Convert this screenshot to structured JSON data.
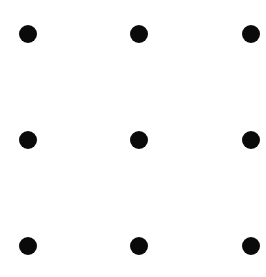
{
  "diagram": {
    "type": "dot-grid",
    "rows": 3,
    "columns": 3,
    "dot_color": "#0a0a0a",
    "background_color": "#ffffff",
    "dot_diameter_px": 18,
    "dots": [
      {
        "row": 0,
        "col": 0,
        "x": 28,
        "y": 34
      },
      {
        "row": 0,
        "col": 1,
        "x": 139,
        "y": 34
      },
      {
        "row": 0,
        "col": 2,
        "x": 251,
        "y": 34
      },
      {
        "row": 1,
        "col": 0,
        "x": 28,
        "y": 140
      },
      {
        "row": 1,
        "col": 1,
        "x": 139,
        "y": 140
      },
      {
        "row": 1,
        "col": 2,
        "x": 251,
        "y": 140
      },
      {
        "row": 2,
        "col": 0,
        "x": 28,
        "y": 246
      },
      {
        "row": 2,
        "col": 1,
        "x": 139,
        "y": 246
      },
      {
        "row": 2,
        "col": 2,
        "x": 251,
        "y": 246
      }
    ]
  }
}
